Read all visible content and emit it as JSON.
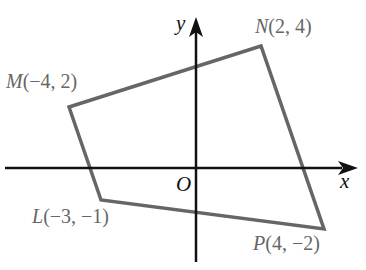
{
  "diagram": {
    "type": "coordinate-plane-quadrilateral",
    "axes": {
      "x_label": "x",
      "y_label": "y",
      "origin_label": "O"
    },
    "points": [
      {
        "name": "M",
        "coords": "(−4, 2)",
        "x": -4,
        "y": 2
      },
      {
        "name": "N",
        "coords": "(2, 4)",
        "x": 2,
        "y": 4
      },
      {
        "name": "P",
        "coords": "(4, −2)",
        "x": 4,
        "y": -2
      },
      {
        "name": "L",
        "coords": "(−3, −1)",
        "x": -3,
        "y": -1
      }
    ],
    "polygon_order": [
      "M",
      "N",
      "P",
      "L"
    ],
    "colors": {
      "axis": "#111111",
      "polygon": "#666666",
      "labels": "#666666"
    }
  }
}
